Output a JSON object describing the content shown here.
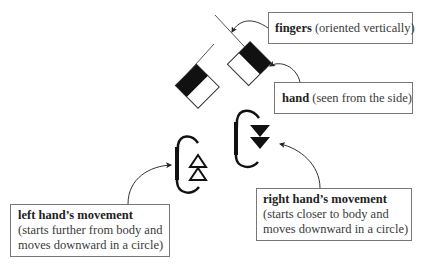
{
  "diagram": {
    "type": "sign-language-notation",
    "labels": {
      "fingers": {
        "bold": "fingers",
        "rest": " (oriented vertically)"
      },
      "hand": {
        "bold": "hand",
        "rest": " (seen from the side)"
      },
      "left_movement": {
        "bold": "left hand’s movement",
        "line2": "(starts further from body and",
        "line3": "moves downward in a circle)"
      },
      "right_movement": {
        "bold": "right hand’s movement",
        "line2": "(starts closer to body and",
        "line3": "moves downward in a circle)"
      }
    },
    "symbols": [
      {
        "name": "left-hand",
        "fingers": "line",
        "palm": "half-filled square rotated 45°"
      },
      {
        "name": "right-hand",
        "fingers": "line",
        "palm": "half-filled square rotated 45°"
      },
      {
        "name": "left-movement",
        "shape": "circular bracket with two hollow up-triangles"
      },
      {
        "name": "right-movement",
        "shape": "circular bracket with two filled down-triangles"
      }
    ],
    "colors": {
      "ink": "#111111",
      "box_border": "#777777",
      "background": "#ffffff"
    }
  }
}
